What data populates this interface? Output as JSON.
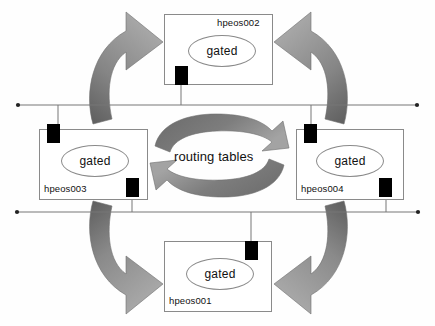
{
  "diagram": {
    "title": "routing tables",
    "center_label": "routing tables",
    "process_label": "gated",
    "colors": {
      "arrow_light": "#9a9a9a",
      "arrow_dark": "#6a6a6a",
      "arrow_darkest": "#4a4a4a",
      "box_border": "#8a8a8a",
      "nic": "#000000",
      "bus_line": "#777777",
      "background": "#ffffff"
    },
    "hosts": [
      {
        "id": "hpeos002",
        "label": "hpeos002",
        "process": "gated",
        "position": "top",
        "box": {
          "x": 164,
          "y": 14,
          "w": 109,
          "h": 71
        },
        "label_pos": {
          "x": 221,
          "y": 19
        },
        "oval": {
          "x": 187,
          "y": 34,
          "w": 66,
          "h": 30
        },
        "nic": {
          "x": 175,
          "y": 66,
          "w": 13,
          "h": 19
        }
      },
      {
        "id": "hpeos003",
        "label": "hpeos003",
        "process": "gated",
        "position": "left",
        "box": {
          "x": 39,
          "y": 129,
          "w": 109,
          "h": 71
        },
        "label_pos": {
          "x": 44,
          "y": 185
        },
        "oval": {
          "x": 61,
          "y": 145,
          "w": 66,
          "h": 30
        },
        "nic": {
          "x": 47,
          "y": 124,
          "w": 13,
          "h": 19
        },
        "nic2": {
          "x": 126,
          "y": 178,
          "w": 13,
          "h": 19
        }
      },
      {
        "id": "hpeos004",
        "label": "hpeos004",
        "process": "gated",
        "position": "right",
        "box": {
          "x": 296,
          "y": 129,
          "w": 108,
          "h": 71
        },
        "label_pos": {
          "x": 301,
          "y": 185
        },
        "oval": {
          "x": 316,
          "y": 145,
          "w": 66,
          "h": 30
        },
        "nic": {
          "x": 304,
          "y": 124,
          "w": 13,
          "h": 19
        },
        "nic2": {
          "x": 379,
          "y": 178,
          "w": 13,
          "h": 19
        }
      },
      {
        "id": "hpeos001",
        "label": "hpeos001",
        "process": "gated",
        "position": "bottom",
        "box": {
          "x": 164,
          "y": 241,
          "w": 108,
          "h": 71
        },
        "label_pos": {
          "x": 169,
          "y": 297
        },
        "oval": {
          "x": 186,
          "y": 258,
          "w": 66,
          "h": 30
        },
        "nic": {
          "x": 245,
          "y": 241,
          "w": 13,
          "h": 19
        }
      }
    ],
    "buses": [
      {
        "name": "upper-network-segment",
        "y": 105,
        "x1": 18,
        "x2": 417
      },
      {
        "name": "lower-network-segment",
        "y": 212,
        "x1": 17,
        "x2": 418
      }
    ],
    "links": [
      {
        "from": "hpeos002",
        "to": "upper-network-segment",
        "x": 181,
        "y1": 85,
        "y2": 105
      },
      {
        "from": "hpeos003",
        "to": "upper-network-segment",
        "x": 58,
        "y1": 105,
        "y2": 129
      },
      {
        "from": "hpeos004",
        "to": "upper-network-segment",
        "x": 311,
        "y1": 105,
        "y2": 129
      },
      {
        "from": "hpeos003",
        "to": "lower-network-segment",
        "x": 132,
        "y1": 196,
        "y2": 212
      },
      {
        "from": "hpeos004",
        "to": "lower-network-segment",
        "x": 386,
        "y1": 196,
        "y2": 212
      },
      {
        "from": "hpeos001",
        "to": "lower-network-segment",
        "x": 251,
        "y1": 212,
        "y2": 241
      }
    ],
    "exchange_arrows": [
      {
        "name": "arrow-hpeos003-to-hpeos002",
        "direction": "up-right"
      },
      {
        "name": "arrow-hpeos004-to-hpeos002",
        "direction": "up-left"
      },
      {
        "name": "arrow-hpeos003-to-hpeos001",
        "direction": "down-right"
      },
      {
        "name": "arrow-hpeos004-to-hpeos001",
        "direction": "down-left"
      },
      {
        "name": "central-cycle-arrow-top",
        "direction": "clockwise"
      },
      {
        "name": "central-cycle-arrow-bottom",
        "direction": "counter-clockwise"
      }
    ]
  }
}
